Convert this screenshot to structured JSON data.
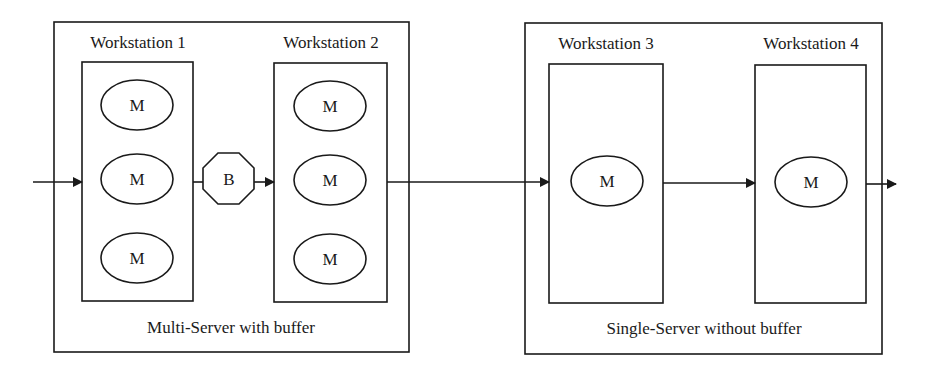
{
  "diagram": {
    "type": "production-line-flow",
    "colors": {
      "line": "#1a1a1a",
      "background": "#ffffff"
    },
    "groups": [
      {
        "label": "Multi-Server with buffer",
        "workstations": [
          {
            "label": "Workstation 1",
            "machines": [
              "M",
              "M",
              "M"
            ]
          },
          {
            "label": "Workstation 2",
            "machines": [
              "M",
              "M",
              "M"
            ]
          }
        ],
        "buffer": {
          "label": "B",
          "shape": "octagon",
          "between": [
            "Workstation 1",
            "Workstation 2"
          ]
        }
      },
      {
        "label": "Single-Server without buffer",
        "workstations": [
          {
            "label": "Workstation 3",
            "machines": [
              "M"
            ]
          },
          {
            "label": "Workstation 4",
            "machines": [
              "M"
            ]
          }
        ]
      }
    ],
    "flow": [
      "input",
      "Workstation 1",
      "B",
      "Workstation 2",
      "Workstation 3",
      "Workstation 4",
      "output"
    ]
  }
}
